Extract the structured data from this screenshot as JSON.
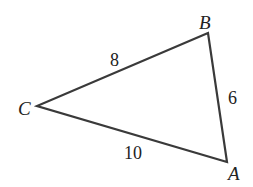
{
  "diagram": {
    "type": "triangle",
    "stroke_color": "#3a3a3a",
    "vertices": [
      {
        "name": "A",
        "label": "A"
      },
      {
        "name": "B",
        "label": "B"
      },
      {
        "name": "C",
        "label": "C"
      }
    ],
    "sides": [
      {
        "between": "CB",
        "label": "8"
      },
      {
        "between": "BA",
        "label": "6"
      },
      {
        "between": "CA",
        "label": "10"
      }
    ]
  }
}
